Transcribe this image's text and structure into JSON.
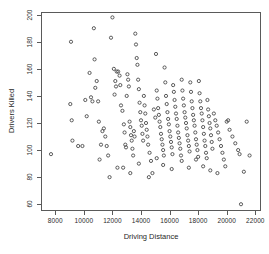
{
  "chart_data": {
    "type": "scatter",
    "title": "",
    "xlabel": "Driving Distance",
    "ylabel": "Drivers Killed",
    "xlim": [
      7000,
      22400
    ],
    "ylim": [
      55,
      202
    ],
    "xticks": [
      8000,
      10000,
      12000,
      14000,
      16000,
      18000,
      20000,
      22000
    ],
    "yticks": [
      60,
      80,
      100,
      120,
      140,
      160,
      180,
      200
    ],
    "xtick_labels": [
      "8000",
      "10000",
      "12000",
      "14000",
      "16000",
      "18000",
      "20000",
      "22000"
    ],
    "ytick_labels": [
      "60",
      "80",
      "100",
      "120",
      "140",
      "160",
      "180",
      "200"
    ],
    "grid": false,
    "legend": false,
    "marker": "open-circle",
    "marker_color": "#4a4a4a",
    "n_points": 192,
    "series": [
      {
        "name": "observations",
        "x": [
          7700,
          9100,
          9150,
          9900,
          10700,
          10750,
          10800,
          11000,
          11900,
          12000,
          12100,
          12150,
          9050,
          9200,
          10400,
          10500,
          10600,
          10900,
          11050,
          11200,
          11400,
          11500,
          11600,
          11700,
          12200,
          12250,
          12300,
          12400,
          12500,
          12550,
          12600,
          12700,
          12800,
          12850,
          12900,
          12950,
          13000,
          13050,
          13100,
          13150,
          13200,
          13250,
          13300,
          13350,
          13400,
          13450,
          13500,
          13550,
          13600,
          13650,
          13700,
          13750,
          13800,
          13850,
          13900,
          13950,
          14000,
          14050,
          14100,
          14150,
          14200,
          14250,
          14300,
          14350,
          14400,
          14450,
          14500,
          14600,
          14700,
          14800,
          14900,
          15000,
          15050,
          15100,
          15150,
          15200,
          15250,
          15300,
          15350,
          15400,
          15450,
          15500,
          15550,
          15600,
          15650,
          15700,
          15750,
          15800,
          15850,
          15900,
          15950,
          16000,
          16050,
          16100,
          16150,
          16200,
          16250,
          16300,
          16350,
          16400,
          16450,
          16500,
          16550,
          16600,
          16650,
          16700,
          16750,
          16800,
          16850,
          16900,
          16950,
          17000,
          17050,
          17100,
          17150,
          17200,
          17250,
          17300,
          17350,
          17400,
          17450,
          17500,
          17550,
          17600,
          17650,
          17700,
          17750,
          17800,
          17850,
          17900,
          17950,
          18000,
          18050,
          18100,
          18150,
          18200,
          18250,
          18300,
          18350,
          18400,
          18450,
          18500,
          18550,
          18600,
          18650,
          18700,
          18750,
          18800,
          18850,
          18900,
          18950,
          19000,
          19100,
          19200,
          19300,
          19400,
          19500,
          19600,
          19700,
          19800,
          19900,
          20000,
          20200,
          20400,
          20600,
          20800,
          21000,
          21200,
          21400,
          21600,
          9600,
          10100,
          10200,
          11100,
          11300,
          12350,
          12750,
          13250,
          13850,
          14550,
          15100,
          15550,
          16150,
          16850,
          17350,
          17850,
          18350,
          18850,
          19350,
          20100,
          20900,
          11800
        ],
        "y": [
          97,
          180,
          122,
          103,
          190,
          167,
          146,
          136,
          183,
          198,
          160,
          141,
          134,
          107,
          157,
          139,
          136,
          151,
          121,
          104,
          116,
          110,
          103,
          96,
          151,
          147,
          158,
          158,
          155,
          148,
          133,
          129,
          119,
          113,
          104,
          102,
          140,
          156,
          152,
          147,
          121,
          117,
          111,
          107,
          101,
          96,
          114,
          110,
          186,
          178,
          168,
          163,
          152,
          145,
          135,
          128,
          122,
          118,
          112,
          107,
          140,
          133,
          127,
          120,
          115,
          110,
          104,
          98,
          92,
          83,
          130,
          124,
          171,
          144,
          138,
          131,
          126,
          121,
          117,
          112,
          108,
          104,
          100,
          96,
          161,
          150,
          140,
          134,
          128,
          123,
          119,
          114,
          110,
          106,
          102,
          97,
          148,
          143,
          137,
          132,
          127,
          123,
          118,
          113,
          109,
          105,
          101,
          96,
          152,
          144,
          138,
          133,
          128,
          124,
          120,
          116,
          111,
          107,
          103,
          99,
          150,
          143,
          136,
          131,
          126,
          122,
          118,
          113,
          108,
          104,
          100,
          95,
          151,
          142,
          136,
          131,
          127,
          122,
          117,
          112,
          107,
          103,
          98,
          94,
          137,
          130,
          125,
          120,
          116,
          111,
          106,
          101,
          127,
          122,
          118,
          113,
          108,
          103,
          98,
          93,
          88,
          121,
          115,
          110,
          105,
          100,
          60,
          84,
          121,
          96,
          103,
          137,
          125,
          93,
          114,
          87,
          87,
          83,
          90,
          80,
          94,
          89,
          86,
          92,
          87,
          93,
          88,
          85,
          83,
          122,
          97,
          80
        ]
      }
    ]
  },
  "axis": {
    "xlabel": "Driving Distance",
    "ylabel": "Drivers Killed"
  }
}
